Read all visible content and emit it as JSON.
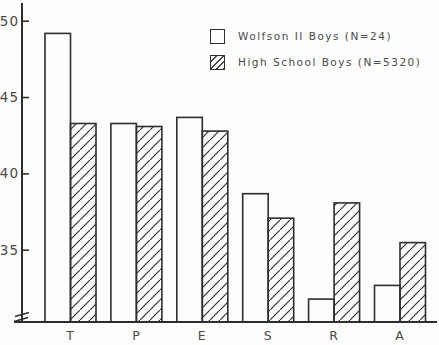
{
  "figure": {
    "background": "#fdfdfb",
    "ink": "#2e2e2e",
    "text_color": "#4a4a4a"
  },
  "legend": {
    "items": [
      {
        "label": "Wolfson II Boys (N=24)",
        "swatch": "open"
      },
      {
        "label": "High School Boys (N=5320)",
        "swatch": "hatched"
      }
    ]
  },
  "chart_data": {
    "type": "bar",
    "title": "",
    "xlabel": "",
    "ylabel": "",
    "categories": [
      "T",
      "P",
      "E",
      "S",
      "R",
      "A"
    ],
    "series": [
      {
        "name": "Wolfson II Boys (N=24)",
        "style": "open",
        "values": [
          49.2,
          43.3,
          43.7,
          38.7,
          31.8,
          32.7
        ]
      },
      {
        "name": "High School Boys (N=5320)",
        "style": "hatched",
        "values": [
          43.3,
          43.1,
          42.8,
          37.1,
          38.1,
          35.5
        ]
      }
    ],
    "ylim": [
      30.3,
      51.3
    ],
    "yticks": [
      50,
      45,
      40,
      35
    ],
    "ytick_labels": [
      "50",
      "45",
      "40",
      "35"
    ],
    "axis_break_bottom": true,
    "grid": false,
    "legend_position": "upper-right"
  }
}
